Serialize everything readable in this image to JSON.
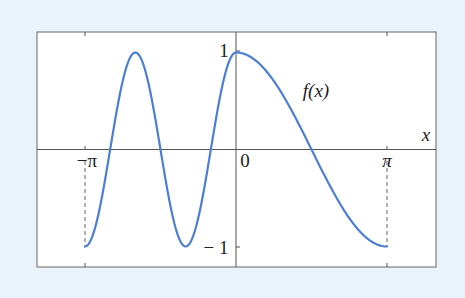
{
  "chart_data": {
    "type": "line",
    "title": "",
    "xlabel": "x",
    "ylabel": "",
    "xlim": [
      -4.13,
      4.17
    ],
    "ylim": [
      -1.21,
      1.0
    ],
    "grid": false,
    "legend": null,
    "x_ticks": [
      {
        "value": -3.14159,
        "label": "−π"
      },
      {
        "value": 0,
        "label": "0"
      },
      {
        "value": 3.14159,
        "label": "π"
      }
    ],
    "y_ticks": [
      {
        "value": 1,
        "label": "1"
      },
      {
        "value": -1,
        "label": "− 1"
      }
    ],
    "series": [
      {
        "name": "f(x)",
        "color": "#4a7fd4",
        "definition": "cos(3x) for -π ≤ x ≤ 0; cos(x) for 0 ≤ x ≤ π",
        "x": [
          -3.1416,
          -2.618,
          -2.0944,
          -1.5708,
          -1.0472,
          -0.5236,
          0,
          0.7854,
          1.5708,
          2.3562,
          3.1416
        ],
        "y": [
          -1,
          0,
          1,
          0,
          -1,
          0,
          1,
          0.707,
          0,
          -0.707,
          -1
        ]
      }
    ],
    "annotations": [
      {
        "text": "f(x)",
        "x": 1.55,
        "y": 0.6
      },
      {
        "text": "dashed vertical line at x = −π from y = 0 to y = −1"
      },
      {
        "text": "dashed vertical line at x = π from y = 0 to y = −1"
      }
    ]
  },
  "labels": {
    "x_axis": "x",
    "curve": "f(x)",
    "neg_pi": "−π",
    "zero": "0",
    "pi": "π",
    "y_one": "1",
    "y_neg_one": "− 1"
  },
  "colors": {
    "background": "#eaf3f9",
    "plot_bg": "#ffffff",
    "curve": "#4a7fd4",
    "axes": "#555555"
  }
}
